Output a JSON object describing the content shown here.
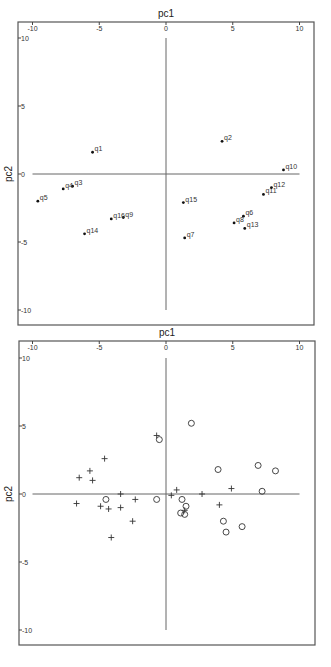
{
  "chart_data": [
    {
      "type": "scatter",
      "title": "",
      "xlabel": "pc1",
      "ylabel": "pc2",
      "xlabel_top": "pc1",
      "xlim": [
        -11,
        11
      ],
      "ylim": [
        -11,
        11
      ],
      "xticks": [
        -10,
        -5,
        0,
        5,
        10
      ],
      "yticks": [
        10,
        5,
        0,
        -5,
        -10
      ],
      "xtick_labels": [
        "-10",
        "-5",
        "0",
        "5",
        "10"
      ],
      "ytick_labels": [
        "10",
        "5",
        "0",
        "-5",
        "-10"
      ],
      "grid": false,
      "reference_lines": {
        "x": 0,
        "y": 0
      },
      "marker": "dot",
      "points": [
        {
          "label": "q1",
          "x": -5.5,
          "y": 1.6
        },
        {
          "label": "q2",
          "x": 4.2,
          "y": 2.4
        },
        {
          "label": "q3",
          "x": -7.0,
          "y": -0.9
        },
        {
          "label": "q4",
          "x": -7.7,
          "y": -1.1
        },
        {
          "label": "q5",
          "x": -9.6,
          "y": -2.0
        },
        {
          "label": "q6",
          "x": 5.8,
          "y": -3.1
        },
        {
          "label": "q7",
          "x": 1.4,
          "y": -4.7
        },
        {
          "label": "q8",
          "x": 5.1,
          "y": -3.6
        },
        {
          "label": "q9",
          "x": -3.2,
          "y": -3.2
        },
        {
          "label": "q10",
          "x": 8.8,
          "y": 0.3
        },
        {
          "label": "q11",
          "x": 7.3,
          "y": -1.5
        },
        {
          "label": "q12",
          "x": 7.9,
          "y": -1.0
        },
        {
          "label": "q13",
          "x": 5.9,
          "y": -4.0
        },
        {
          "label": "q14",
          "x": -6.1,
          "y": -4.4
        },
        {
          "label": "q15",
          "x": 1.3,
          "y": -2.1
        },
        {
          "label": "q16",
          "x": -4.1,
          "y": -3.3
        }
      ]
    },
    {
      "type": "scatter",
      "title": "",
      "xlabel": "pc1",
      "ylabel": "pc2",
      "xlabel_top": "pc1",
      "xlim": [
        -11,
        11
      ],
      "ylim": [
        -11,
        11
      ],
      "xticks": [
        -10,
        -5,
        0,
        5,
        10
      ],
      "yticks": [
        10,
        5,
        0,
        -5,
        -10
      ],
      "xtick_labels": [
        "-10",
        "-5",
        "0",
        "5",
        "10"
      ],
      "ytick_labels": [
        "10",
        "5",
        "0",
        "-5",
        "-10"
      ],
      "grid": false,
      "reference_lines": {
        "x": 0,
        "y": 0
      },
      "series": [
        {
          "name": "cross",
          "marker": "+",
          "points": [
            {
              "x": -4.6,
              "y": 2.6
            },
            {
              "x": -5.7,
              "y": 1.7
            },
            {
              "x": -6.5,
              "y": 1.2
            },
            {
              "x": -5.5,
              "y": 1.0
            },
            {
              "x": -6.7,
              "y": -0.7
            },
            {
              "x": -4.9,
              "y": -0.9
            },
            {
              "x": -4.3,
              "y": -1.1
            },
            {
              "x": -4.1,
              "y": -3.2
            },
            {
              "x": -3.4,
              "y": 0.0
            },
            {
              "x": -2.3,
              "y": -0.4
            },
            {
              "x": -3.4,
              "y": -1.0
            },
            {
              "x": -2.5,
              "y": -2.0
            },
            {
              "x": 0.4,
              "y": -0.1
            },
            {
              "x": 0.8,
              "y": 0.3
            },
            {
              "x": 1.4,
              "y": -1.2
            },
            {
              "x": -0.7,
              "y": 4.3
            },
            {
              "x": 2.7,
              "y": 0.0
            },
            {
              "x": 4.9,
              "y": 0.4
            },
            {
              "x": 4.0,
              "y": -0.8
            }
          ]
        },
        {
          "name": "circle",
          "marker": "o",
          "points": [
            {
              "x": -4.5,
              "y": -0.4
            },
            {
              "x": -0.7,
              "y": -0.4
            },
            {
              "x": 1.2,
              "y": -0.4
            },
            {
              "x": 1.5,
              "y": -0.9
            },
            {
              "x": 1.1,
              "y": -1.4
            },
            {
              "x": 1.4,
              "y": -1.5
            },
            {
              "x": -0.5,
              "y": 4.0
            },
            {
              "x": 1.9,
              "y": 5.2
            },
            {
              "x": 3.9,
              "y": 1.8
            },
            {
              "x": 6.9,
              "y": 2.1
            },
            {
              "x": 8.2,
              "y": 1.7
            },
            {
              "x": 7.2,
              "y": 0.2
            },
            {
              "x": 4.3,
              "y": -2.0
            },
            {
              "x": 4.5,
              "y": -2.8
            },
            {
              "x": 5.7,
              "y": -2.4
            }
          ]
        }
      ]
    }
  ]
}
